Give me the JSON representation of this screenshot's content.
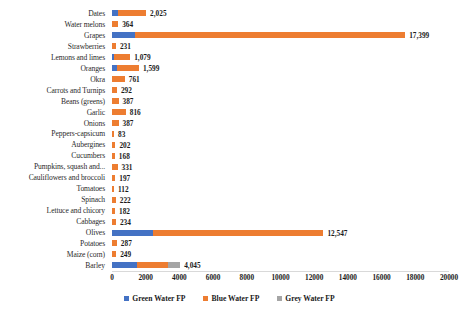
{
  "chart_data": {
    "type": "bar",
    "orientation": "horizontal",
    "stacked": true,
    "title": "",
    "subtitle": "",
    "xlabel": "",
    "ylabel": "",
    "xlim": [
      0,
      20000
    ],
    "xticks": [
      0,
      2000,
      4000,
      6000,
      8000,
      10000,
      12000,
      14000,
      16000,
      18000,
      20000
    ],
    "xtick_labels": [
      "0",
      "2000",
      "4000",
      "6000",
      "8000",
      "10000",
      "12000",
      "14000",
      "16000",
      "18000",
      "20000"
    ],
    "grid": false,
    "legend_position": "bottom",
    "categories": [
      "Dates",
      "Water melons",
      "Grapes",
      "Strawberries",
      "Lemons and limes",
      "Oranges",
      "Okra",
      "Carrots and Turnips",
      "Beans (greens)",
      "Garlic",
      "Onions",
      "Peppers-capsicum",
      "Aubergines",
      "Cucumbers",
      "Pumpkins, squash and...",
      "Cauliflowers and broccoli",
      "Tomatoes",
      "Spinach",
      "Lettuce and chicory",
      "Cabbages",
      "Olives",
      "Potatoes",
      "Maize (corn)",
      "Barley"
    ],
    "series": [
      {
        "name": "Green Water FP",
        "color": "#4472c4",
        "values": [
          330,
          0,
          1390,
          0,
          140,
          300,
          0,
          0,
          0,
          0,
          0,
          0,
          0,
          0,
          0,
          0,
          0,
          0,
          0,
          0,
          2430,
          0,
          0,
          1480
        ]
      },
      {
        "name": "Blue Water FP",
        "color": "#ed7d31",
        "values": [
          1695,
          364,
          16009,
          231,
          939,
          1299,
          761,
          292,
          387,
          816,
          387,
          83,
          202,
          168,
          331,
          197,
          112,
          222,
          182,
          234,
          10117,
          287,
          249,
          1830
        ]
      },
      {
        "name": "Grey Water FP",
        "color": "#a5a5a5",
        "values": [
          0,
          0,
          0,
          0,
          0,
          0,
          0,
          0,
          0,
          0,
          0,
          0,
          0,
          0,
          0,
          0,
          0,
          0,
          0,
          0,
          0,
          0,
          0,
          735
        ]
      }
    ],
    "totals": [
      2025,
      364,
      17399,
      231,
      1079,
      1599,
      761,
      292,
      387,
      816,
      387,
      83,
      202,
      168,
      331,
      197,
      112,
      222,
      182,
      234,
      12547,
      287,
      249,
      4045
    ],
    "total_labels": [
      "2,025",
      "364",
      "17,399",
      "231",
      "1,079",
      "1,599",
      "761",
      "292",
      "387",
      "816",
      "387",
      "83",
      "202",
      "168",
      "331",
      "197",
      "112",
      "222",
      "182",
      "234",
      "12,547",
      "287",
      "249",
      "4,045"
    ]
  },
  "legend": {
    "items": [
      {
        "label": "Green Water FP",
        "color": "#4472c4"
      },
      {
        "label": "Blue Water FP",
        "color": "#ed7d31"
      },
      {
        "label": "Grey Water FP",
        "color": "#a5a5a5"
      }
    ]
  }
}
